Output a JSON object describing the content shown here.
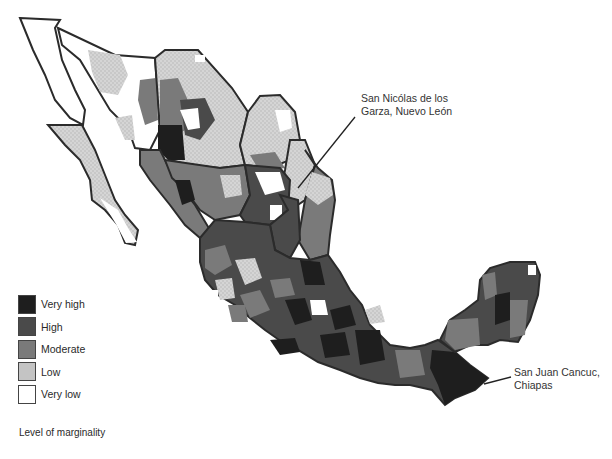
{
  "map": {
    "subject": "Mexico municipalities by level of marginality",
    "colors": {
      "very_high": "#1e1e1e",
      "high": "#4a4a4a",
      "moderate": "#7a7a7a",
      "low": "#c4c4c4",
      "very_low": "#ffffff",
      "border": "#2b2b2b"
    }
  },
  "legend": {
    "title": "Level of marginality",
    "items": [
      {
        "label": "Very high",
        "color": "#1e1e1e"
      },
      {
        "label": "High",
        "color": "#4a4a4a"
      },
      {
        "label": "Moderate",
        "color": "#7a7a7a"
      },
      {
        "label": "Low",
        "color": "#c4c4c4"
      },
      {
        "label": "Very low",
        "color": "#ffffff"
      }
    ]
  },
  "callouts": [
    {
      "line1": "San Nicólas de los",
      "line2": "Garza, Nuevo León"
    },
    {
      "line1": "San Juan Cancuc,",
      "line2": "Chiapas"
    }
  ]
}
